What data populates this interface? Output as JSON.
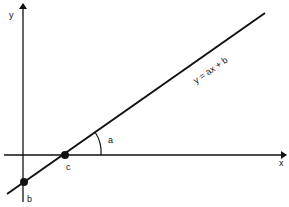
{
  "diagram": {
    "type": "linear-function-graph",
    "axes": {
      "x_label": "x",
      "y_label": "y"
    },
    "line": {
      "equation": "y = ax + b",
      "color": "#111111"
    },
    "points": [
      {
        "label": "b",
        "description": "y-intercept"
      },
      {
        "label": "c",
        "description": "x-intercept"
      }
    ],
    "angle": {
      "label": "a",
      "description": "slope angle"
    }
  }
}
